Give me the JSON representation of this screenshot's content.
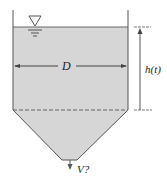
{
  "diagram": {
    "labels": {
      "diameter": "D",
      "height": "h(t)",
      "outflow": "V?"
    },
    "colors": {
      "liquid_fill": "#d6d6d6",
      "outline": "#555555",
      "background": "#ffffff"
    }
  }
}
